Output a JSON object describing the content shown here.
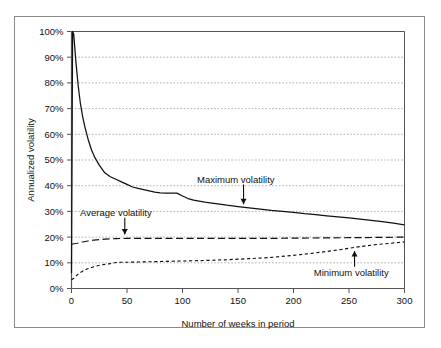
{
  "figure": {
    "background_color": "#ffffff",
    "frame_color": "#8a8a8a",
    "axis_color": "#555555",
    "grid_color": "#9a9a9a",
    "curve_color": "#111111"
  },
  "chart_data": {
    "type": "line",
    "title": "",
    "xlabel": "Number of weeks in period",
    "ylabel": "Annualized volatility",
    "xlim": [
      0,
      300
    ],
    "ylim": [
      0,
      100
    ],
    "grid": true,
    "grid_axis": "y",
    "legend_position": "none",
    "xticks": [
      0,
      50,
      100,
      150,
      200,
      250,
      300
    ],
    "xticklabels": [
      "0",
      "50",
      "100",
      "150",
      "200",
      "250",
      "300"
    ],
    "yticks": [
      0,
      10,
      20,
      30,
      40,
      50,
      60,
      70,
      80,
      90,
      100
    ],
    "yticklabels": [
      "0%",
      "10%",
      "20%",
      "30%",
      "40%",
      "50%",
      "60%",
      "70%",
      "80%",
      "90%",
      "100%"
    ],
    "y_unit": "%",
    "series": [
      {
        "name": "Maximum volatility",
        "style": "solid",
        "x": [
          0,
          1,
          2,
          4,
          6,
          8,
          10,
          12,
          15,
          18,
          21,
          25,
          30,
          35,
          40,
          45,
          50,
          55,
          60,
          65,
          70,
          75,
          80,
          85,
          90,
          95,
          100,
          105,
          110,
          120,
          130,
          140,
          150,
          160,
          170,
          180,
          190,
          200,
          210,
          220,
          230,
          240,
          250,
          260,
          270,
          280,
          290,
          300
        ],
        "y": [
          6,
          100,
          99,
          88,
          79,
          72,
          67,
          63,
          58,
          54,
          51,
          48,
          45,
          43.5,
          42.5,
          41.5,
          40.5,
          39.5,
          39,
          38.5,
          38,
          37.5,
          37.2,
          37.1,
          37.1,
          37.1,
          36,
          35,
          34.4,
          33.6,
          33,
          32.4,
          31.9,
          31.4,
          30.9,
          30.4,
          30,
          29.6,
          29.1,
          28.7,
          28.3,
          27.9,
          27.5,
          27.0,
          26.5,
          26.0,
          25.4,
          24.8
        ]
      },
      {
        "name": "Average volatility",
        "style": "dashed-long",
        "x": [
          0,
          5,
          10,
          15,
          20,
          25,
          30,
          40,
          50,
          60,
          80,
          100,
          120,
          150,
          180,
          200,
          230,
          260,
          280,
          300
        ],
        "y": [
          17.2,
          17.6,
          18.1,
          18.5,
          18.8,
          19.0,
          19.2,
          19.4,
          19.5,
          19.5,
          19.5,
          19.5,
          19.5,
          19.5,
          19.5,
          19.6,
          19.7,
          19.8,
          19.9,
          20.0
        ]
      },
      {
        "name": "Minimum volatility",
        "style": "dashed-short",
        "x": [
          0,
          2,
          5,
          8,
          11,
          14,
          18,
          22,
          26,
          30,
          35,
          40,
          45,
          50,
          60,
          70,
          80,
          90,
          100,
          120,
          140,
          160,
          180,
          200,
          215,
          230,
          245,
          255,
          265,
          275,
          285,
          295,
          300
        ],
        "y": [
          3.4,
          4.0,
          5.2,
          6.2,
          7.0,
          7.6,
          8.2,
          8.7,
          9.1,
          9.4,
          9.7,
          10.1,
          10.2,
          10.2,
          10.3,
          10.4,
          10.5,
          10.6,
          10.7,
          10.9,
          11.2,
          11.6,
          12.1,
          12.9,
          13.6,
          14.4,
          15.3,
          16.0,
          16.6,
          17.1,
          17.5,
          17.9,
          18.1
        ]
      }
    ],
    "annotations": [
      {
        "label": "Average volatility",
        "text_x": 40,
        "text_y": 29.5,
        "arrow_from": [
          48,
          27.5
        ],
        "arrow_to": [
          48,
          21.0
        ],
        "arrow_direction": "down",
        "target_series": "Average volatility"
      },
      {
        "label": "Maximum volatility",
        "text_x": 148,
        "text_y": 42.5,
        "arrow_from": [
          155,
          40.5
        ],
        "arrow_to": [
          155,
          32.8
        ],
        "arrow_direction": "down",
        "target_series": "Maximum volatility"
      },
      {
        "label": "Minimum volatility",
        "text_x": 252,
        "text_y": 6.0,
        "arrow_from": [
          255,
          8.5
        ],
        "arrow_to": [
          255,
          14.6
        ],
        "arrow_direction": "up",
        "target_series": "Minimum volatility"
      }
    ]
  }
}
